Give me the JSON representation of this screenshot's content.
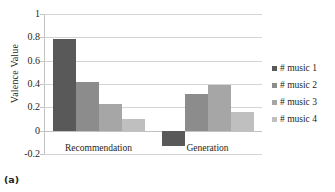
{
  "caption": "(a)",
  "title_remnant": "",
  "chart_data": {
    "type": "bar",
    "title": "",
    "xlabel": "",
    "ylabel": "Valence Value",
    "categories": [
      "Recommendation",
      "Generation"
    ],
    "series": [
      {
        "name": "# music 1",
        "color": "#595959",
        "values": [
          0.79,
          -0.135
        ]
      },
      {
        "name": "# music 2",
        "color": "#8c8c8c",
        "values": [
          0.415,
          0.315
        ]
      },
      {
        "name": "# music 3",
        "color": "#a6a6a6",
        "values": [
          0.225,
          0.395
        ]
      },
      {
        "name": "# music 4",
        "color": "#bfbfbf",
        "values": [
          0.1,
          0.16
        ]
      }
    ],
    "ylim": [
      -0.2,
      1
    ],
    "yticks": [
      1,
      0.8,
      0.6,
      0.4,
      0.2,
      0,
      -0.2
    ],
    "ytick_labels": [
      "1",
      "0.8",
      "0.6",
      "0.4",
      "0.2",
      "0",
      "-0.2"
    ],
    "grid": true,
    "legend_position": "right"
  }
}
